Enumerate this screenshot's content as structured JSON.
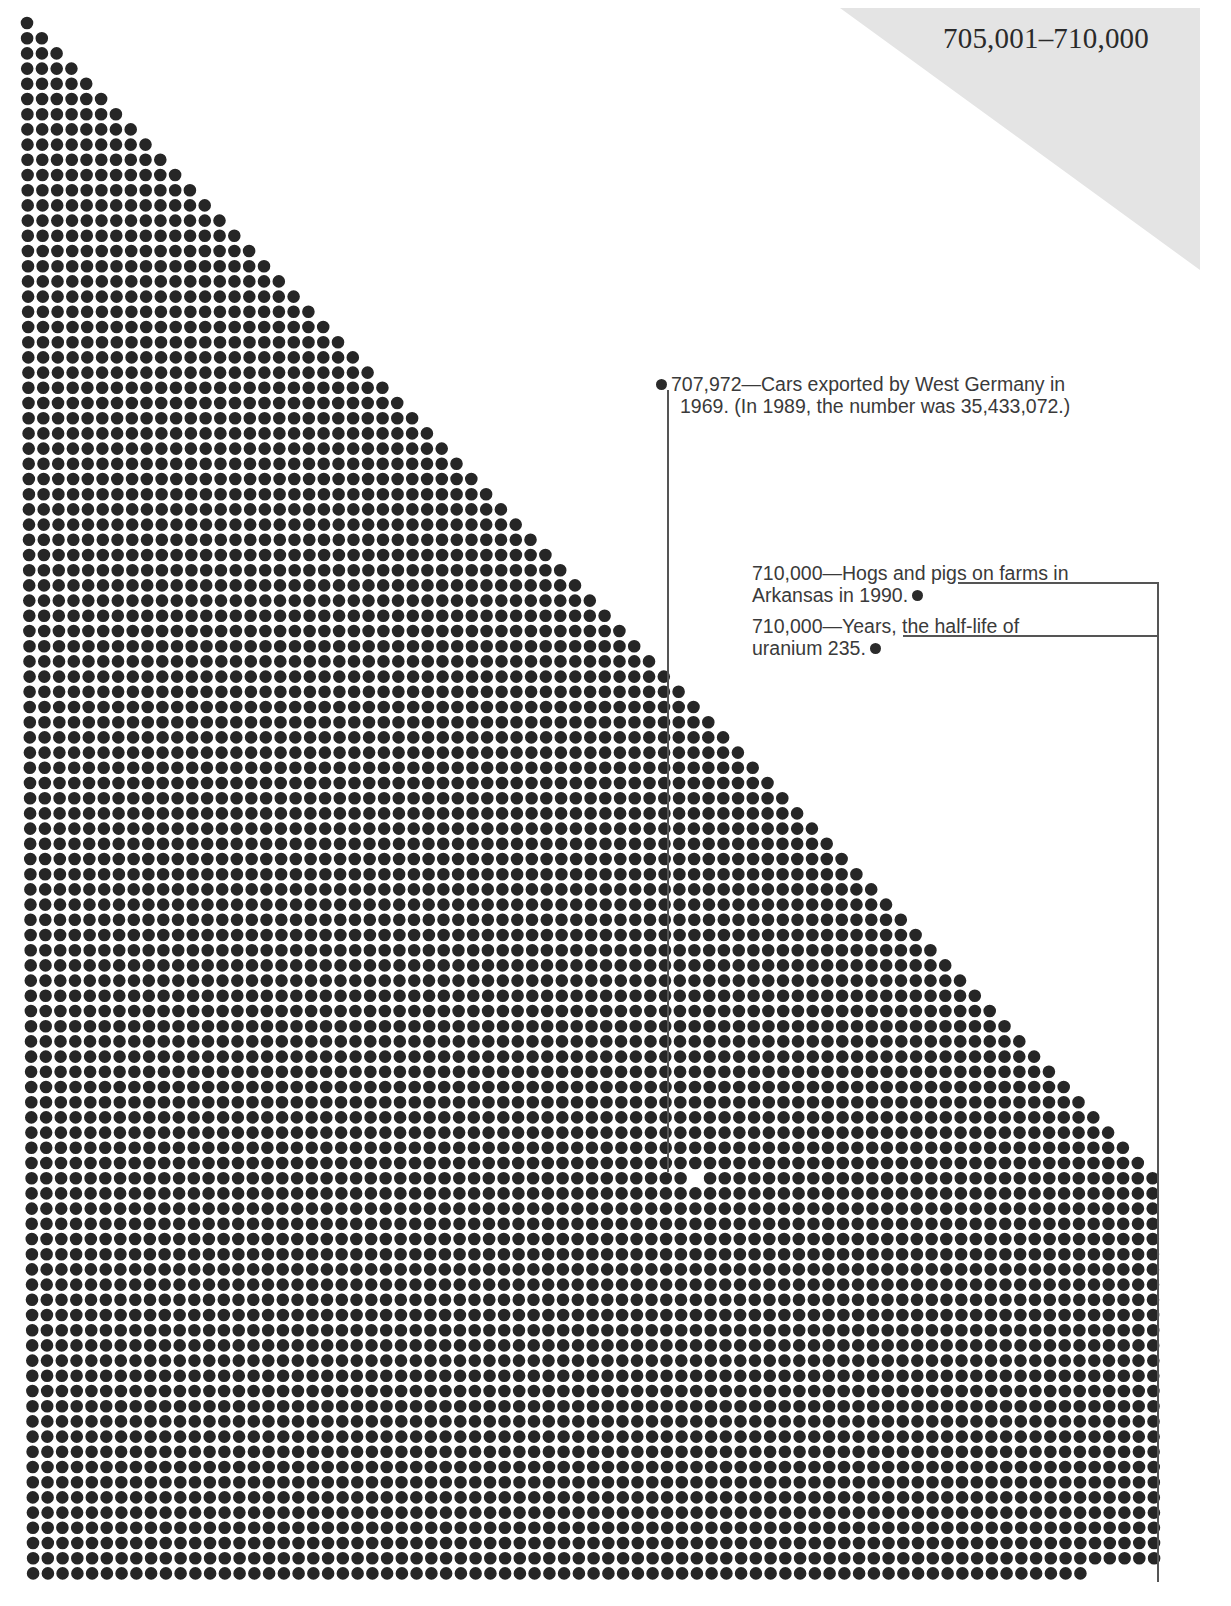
{
  "page": {
    "range_title": "705,001–710,000",
    "corner_color": "#e4e4e4"
  },
  "chart_data": {
    "type": "dot-matrix",
    "title": "705,001–710,000",
    "total_dots": 5000,
    "range_start": 705001,
    "range_end": 710000,
    "grid": {
      "columns": 77,
      "origin_x": 27,
      "origin_y": 23,
      "pitch_x": 14.75,
      "pitch_y": 15.2,
      "dot_radius": 6.3,
      "dot_color": "#262626"
    },
    "highlighted_values": [
      {
        "value": 707972,
        "label": "Cars exported by West Germany in 1969. (In 1989, the number was 35,433,072.)"
      },
      {
        "value": 710000,
        "label": "Hogs and pigs on farms in Arkansas in 1990."
      },
      {
        "value": 710000,
        "label": "Years, the half-life of uranium 235."
      }
    ]
  },
  "annotations": [
    {
      "id": "cars",
      "value_text": "707,972",
      "line1": "—Cars exported by West Germany in",
      "line2": "1969. (In 1989, the number was 35,433,072.)"
    },
    {
      "id": "hogs",
      "value_text": "710,000",
      "line1": "—Hogs and pigs on farms in",
      "line2": "Arkansas in 1990."
    },
    {
      "id": "uranium",
      "value_text": "710,000",
      "line1": "—Years, the half-life of",
      "line2": "uranium 235."
    }
  ]
}
